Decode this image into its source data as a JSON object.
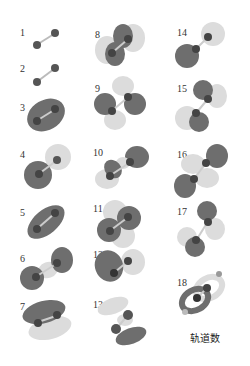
{
  "figure": {
    "caption": "轨道数",
    "colors": {
      "positive_lobe": "#6e6e6e",
      "negative_lobe": "#dcdcdc",
      "atom": "#4a4a4a",
      "bond": "#cccccc",
      "background": "#ffffff"
    },
    "orbitals": [
      {
        "label": "1",
        "type": "bare-bond"
      },
      {
        "label": "2",
        "type": "bare-bond"
      },
      {
        "label": "3",
        "type": "sigma-dark"
      },
      {
        "label": "4",
        "type": "two-lobe-dark-light"
      },
      {
        "label": "5",
        "type": "sigma-dark-peanut"
      },
      {
        "label": "6",
        "type": "two-lobe-dark-dark"
      },
      {
        "label": "7",
        "type": "pi-dark-light"
      },
      {
        "label": "8",
        "type": "four-lobe"
      },
      {
        "label": "9",
        "type": "four-lobe"
      },
      {
        "label": "10",
        "type": "four-lobe-axial"
      },
      {
        "label": "11",
        "type": "four-lobe"
      },
      {
        "label": "12",
        "type": "two-lobe-dark-light"
      },
      {
        "label": "13",
        "type": "pi-light-dark"
      },
      {
        "label": "14",
        "type": "two-lobe-dark-light"
      },
      {
        "label": "15",
        "type": "four-lobe"
      },
      {
        "label": "16",
        "type": "four-lobe"
      },
      {
        "label": "17",
        "type": "four-lobe"
      },
      {
        "label": "18",
        "type": "ring"
      }
    ]
  }
}
